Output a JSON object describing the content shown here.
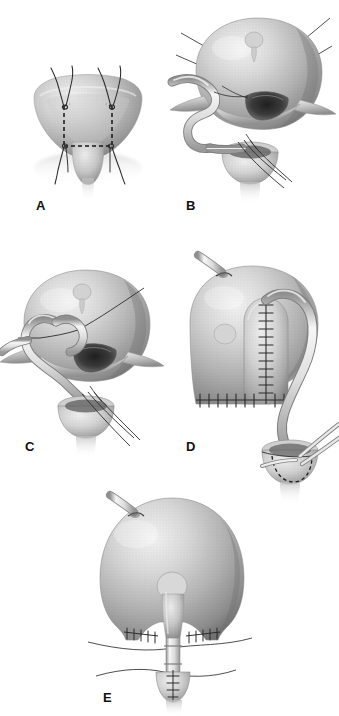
{
  "figure": {
    "type": "medical-surgical-illustration",
    "style": "grayscale halftone line art",
    "background_color": "#ffffff",
    "width": 339,
    "height": 716,
    "panel_count": 5
  },
  "palette": {
    "background": "#ffffff",
    "ink": "#111111",
    "organ_light": "#e6e6e6",
    "organ_mid": "#b9b9b9",
    "organ_dark": "#8a8a8a",
    "organ_shadow": "#5e5e5e",
    "cavity_dark": "#3a3a3a",
    "tube_light": "#f2f2f2",
    "tube_mid": "#cfcfcf",
    "tube_edge": "#7a7a7a",
    "suture": "#2b2b2b",
    "dashed_outline": "#1a1a1a"
  },
  "panels": [
    {
      "id": "A",
      "label": "A",
      "caption": "Bladder with dashed rectangular flap outline and four stay sutures",
      "elements": [
        "bladder-dome",
        "dashed-flap-outline",
        "stay-suture-upper-left",
        "stay-suture-upper-right",
        "stay-suture-lower-left",
        "stay-suture-lower-right",
        "bladder-neck"
      ]
    },
    {
      "id": "B",
      "label": "B",
      "caption": "Bladder flap incised and reflected; ureter drawn into bladder lumen with traction sutures",
      "elements": [
        "bladder-dome",
        "reflected-flap",
        "open-bladder-lumen",
        "ureter-tube",
        "traction-suture-lines",
        "prostate-urethra-stump",
        "anastomosis-sutures"
      ]
    },
    {
      "id": "C",
      "label": "C",
      "caption": "Ureter anastomosed to the flap; running suture placed along the mucosa",
      "elements": [
        "bladder-dome",
        "reflected-flap",
        "open-bladder-lumen",
        "ureter-tube",
        "running-suture",
        "prostate-urethra-stump",
        "anastomosis-sutures"
      ]
    },
    {
      "id": "D",
      "label": "D",
      "caption": "Flap tubularized over the ureter with an interrupted suture ladder; cystostomy tube in place",
      "elements": [
        "bladder-dome",
        "cystostomy-tube",
        "tubularized-flap",
        "vertical-suture-ladder",
        "horizontal-suture-line",
        "ureter-tube",
        "urethral-stump",
        "dashed-anastomosis-outline",
        "forceps"
      ]
    },
    {
      "id": "E",
      "label": "E",
      "caption": "Completed repair viewed from the front with closed suture lines and indwelling catheter",
      "elements": [
        "bladder-dome",
        "cystostomy-tube",
        "closed-suture-line-left",
        "closed-suture-line-right",
        "urethral-catheter",
        "urethral-anastomosis",
        "retractor-tape-upper",
        "retractor-tape-lower"
      ]
    }
  ],
  "labels": {
    "a": "A",
    "b": "B",
    "c": "C",
    "d": "D",
    "e": "E"
  }
}
